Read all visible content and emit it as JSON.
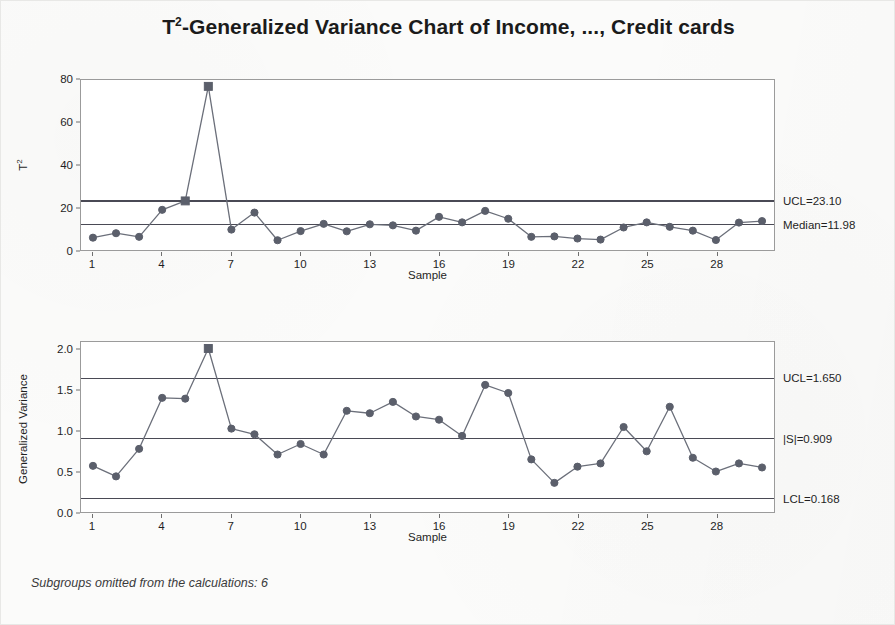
{
  "title": {
    "prefix": "T",
    "sup": "2",
    "rest": "-Generalized Variance Chart of Income, ..., Credit cards",
    "full": "T2-Generalized Variance Chart of Income, ..., Credit cards"
  },
  "footnote": "Subgroups omitted from the calculations: 6",
  "colors": {
    "series": "#6b6f7a",
    "marker": "#5b5f6b",
    "out_of_control_marker": "#5b5f6b",
    "control_limit": "#4a4a55",
    "center_line": "#4a4a55",
    "frame": "#9b9b9b",
    "text": "#1f1f1f",
    "background": "#fbfbfa",
    "plot_background": "#ffffff"
  },
  "panels": {
    "t2": {
      "ylabel": "T2",
      "ylabel_base": "T",
      "ylabel_sup": "2",
      "xlabel": "Sample",
      "limits": [
        {
          "name": "ucl",
          "label": "UCL=23.10",
          "value": 23.1
        },
        {
          "name": "median",
          "label": "Median=11.98",
          "value": 11.98
        }
      ]
    },
    "gv": {
      "ylabel": "Generalized Variance",
      "xlabel": "Sample",
      "limits": [
        {
          "name": "ucl",
          "label": "UCL=1.650",
          "value": 1.65
        },
        {
          "name": "center",
          "label": "|S|=0.909",
          "value": 0.909
        },
        {
          "name": "lcl",
          "label": "LCL=0.168",
          "value": 0.168
        }
      ]
    }
  },
  "chart_data": [
    {
      "type": "line",
      "name": "t2-chart",
      "title": "T2-Generalized Variance Chart of Income, ..., Credit cards",
      "xlabel": "Sample",
      "ylabel": "T2",
      "ylim": [
        0,
        80
      ],
      "yticks": [
        0,
        20,
        40,
        60,
        80
      ],
      "ytick_labels": [
        "0",
        "20",
        "40",
        "60",
        "80"
      ],
      "xlim": [
        1,
        30
      ],
      "xticks": [
        1,
        4,
        7,
        10,
        13,
        16,
        19,
        22,
        25,
        28
      ],
      "xtick_labels": [
        "1",
        "4",
        "7",
        "10",
        "13",
        "16",
        "19",
        "22",
        "25",
        "28"
      ],
      "grid": false,
      "legend": "none",
      "x": [
        1,
        2,
        3,
        4,
        5,
        6,
        7,
        8,
        9,
        10,
        11,
        12,
        13,
        14,
        15,
        16,
        17,
        18,
        19,
        20,
        21,
        22,
        23,
        24,
        25,
        26,
        27,
        28,
        29,
        30
      ],
      "values": [
        5.8,
        7.9,
        6.2,
        18.9,
        23.1,
        77.0,
        9.6,
        17.6,
        4.6,
        8.9,
        12.3,
        8.8,
        12.1,
        11.6,
        9.1,
        15.6,
        13.0,
        18.4,
        14.7,
        6.2,
        6.4,
        5.4,
        4.9,
        10.6,
        13.0,
        10.9,
        9.1,
        4.7,
        12.9,
        13.6
      ],
      "out_of_control_points": [
        5,
        6
      ],
      "reference_lines": [
        {
          "label": "UCL=23.10",
          "value": 23.1
        },
        {
          "label": "Median=11.98",
          "value": 11.98
        }
      ]
    },
    {
      "type": "line",
      "name": "generalized-variance-chart",
      "title": "Generalized Variance",
      "xlabel": "Sample",
      "ylabel": "Generalized Variance",
      "ylim": [
        0.0,
        2.1
      ],
      "yticks": [
        0.0,
        0.5,
        1.0,
        1.5,
        2.0
      ],
      "ytick_labels": [
        "0.0",
        "0.5",
        "1.0",
        "1.5",
        "2.0"
      ],
      "xlim": [
        1,
        30
      ],
      "xticks": [
        1,
        4,
        7,
        10,
        13,
        16,
        19,
        22,
        25,
        28
      ],
      "xtick_labels": [
        "1",
        "4",
        "7",
        "10",
        "13",
        "16",
        "19",
        "22",
        "25",
        "28"
      ],
      "grid": false,
      "legend": "none",
      "x": [
        1,
        2,
        3,
        4,
        5,
        6,
        7,
        8,
        9,
        10,
        11,
        12,
        13,
        14,
        15,
        16,
        17,
        18,
        19,
        20,
        21,
        22,
        23,
        24,
        25,
        26,
        27,
        28,
        29,
        30
      ],
      "values": [
        0.57,
        0.44,
        0.78,
        1.41,
        1.4,
        2.02,
        1.03,
        0.96,
        0.71,
        0.84,
        0.71,
        1.25,
        1.22,
        1.36,
        1.18,
        1.14,
        0.94,
        1.57,
        1.47,
        0.65,
        0.36,
        0.56,
        0.6,
        1.05,
        0.75,
        1.3,
        0.67,
        0.5,
        0.6,
        0.55
      ],
      "out_of_control_points": [
        6
      ],
      "reference_lines": [
        {
          "label": "UCL=1.650",
          "value": 1.65
        },
        {
          "label": "|S|=0.909",
          "value": 0.909
        },
        {
          "label": "LCL=0.168",
          "value": 0.168
        }
      ]
    }
  ]
}
